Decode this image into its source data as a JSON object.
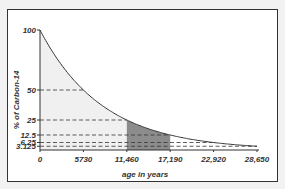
{
  "chart_data": {
    "type": "line",
    "title": "",
    "xlabel": "age in years",
    "ylabel": "% of Carbon-14",
    "x_ticks": [
      "0",
      "5730",
      "11,460",
      "17,190",
      "22,920",
      "28,650"
    ],
    "y_ticks": [
      "100",
      "50",
      "25",
      "12.5",
      "6.25",
      "3.125"
    ],
    "x": [
      0,
      5730,
      11460,
      17190,
      22920,
      28650
    ],
    "series": [
      {
        "name": "% of Carbon-14 remaining",
        "values": [
          100,
          50,
          25,
          12.5,
          6.25,
          3.125
        ]
      }
    ],
    "xlim": [
      0,
      28650
    ],
    "ylim": [
      0,
      100
    ],
    "shaded_regions": [
      {
        "from": 0,
        "to": 11460,
        "color": "#f0f0f0"
      },
      {
        "from": 11460,
        "to": 17190,
        "color": "#8c8c8c"
      }
    ],
    "reference_lines": "dashed horizontal lines at each half-life level",
    "grid": false,
    "legend": "none"
  },
  "colors": {
    "curve": "#333333",
    "light_fill": "#f0f0f0",
    "dark_fill": "#8c8c8c",
    "frame": "#333333"
  }
}
